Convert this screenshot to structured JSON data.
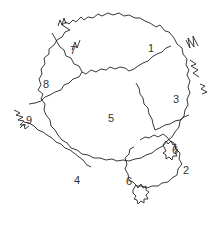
{
  "diagram": {
    "type": "tree-crown-plan",
    "stroke_color": "#222222",
    "background": "#ffffff",
    "regions": [
      {
        "label": "1",
        "x": 151,
        "y": 48
      },
      {
        "label": "2",
        "x": 186,
        "y": 170
      },
      {
        "label": "3",
        "x": 176,
        "y": 99
      },
      {
        "label": "4",
        "x": 77,
        "y": 180
      },
      {
        "label": "5",
        "x": 111,
        "y": 118
      },
      {
        "label": "6",
        "x": 175,
        "y": 150
      },
      {
        "label": "6b",
        "display": "6",
        "x": 129,
        "y": 181
      },
      {
        "label": "7",
        "x": 73,
        "y": 50
      },
      {
        "label": "8",
        "x": 46,
        "y": 84
      },
      {
        "label": "9",
        "x": 29,
        "y": 120
      }
    ],
    "labels": {
      "r1": "1",
      "r2": "2",
      "r3": "3",
      "r4": "4",
      "r5": "5",
      "r6a": "6",
      "r6b": "6",
      "r7": "7",
      "r8": "8",
      "r9": "9"
    }
  }
}
